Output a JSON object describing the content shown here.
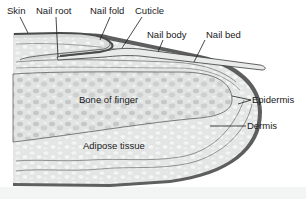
{
  "labels": {
    "skin": "Skin",
    "nail_root": "Nail root",
    "nail_fold": "Nail fold",
    "cuticle": "Cuticle",
    "nail_body": "Nail body",
    "nail_bed": "Nail bed",
    "bone": "Bone of finger",
    "epidermis": "Epidermis",
    "dermis": "Dermis",
    "adipose": "Adipose tissue"
  },
  "colors": {
    "skin_outer": "#5a5a5a",
    "tissue_fill": "#e6e8e8",
    "bone_fill": "#d9dbdb",
    "nail_fill": "#e9ebea",
    "line": "#3a3a3a"
  }
}
